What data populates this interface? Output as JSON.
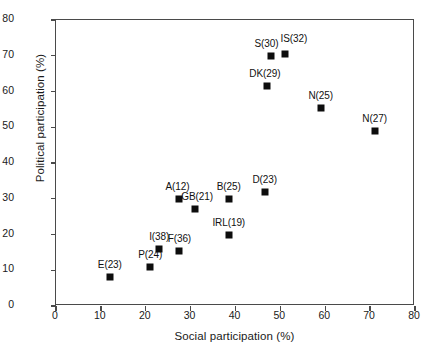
{
  "chart_data": {
    "type": "scatter",
    "title": "",
    "xlabel": "Social participation (%)",
    "ylabel": "Political participation (%)",
    "xlim": [
      0,
      80
    ],
    "ylim": [
      0,
      80
    ],
    "xticks": [
      0,
      10,
      20,
      30,
      40,
      50,
      60,
      70,
      80
    ],
    "yticks": [
      0,
      10,
      20,
      30,
      40,
      50,
      60,
      70,
      80
    ],
    "grid": false,
    "legend": "none",
    "marker_style": "filled-square-black",
    "points": [
      {
        "label": "E(23)",
        "x": 12,
        "y": 8,
        "label_dx": 0,
        "label_dy": -18
      },
      {
        "label": "P(24)",
        "x": 21,
        "y": 11,
        "label_dx": 0,
        "label_dy": -18
      },
      {
        "label": "I(38)",
        "x": 23,
        "y": 16,
        "label_dx": 0,
        "label_dy": -18
      },
      {
        "label": "F(36)",
        "x": 27.5,
        "y": 15.5,
        "label_dx": 0,
        "label_dy": -18
      },
      {
        "label": "A(12)",
        "x": 27.5,
        "y": 30,
        "label_dx": -2,
        "label_dy": -18
      },
      {
        "label": "GB(21)",
        "x": 31,
        "y": 27,
        "label_dx": 2,
        "label_dy": -18
      },
      {
        "label": "IRL(19)",
        "x": 38.5,
        "y": 20,
        "label_dx": 0,
        "label_dy": -18
      },
      {
        "label": "B(25)",
        "x": 38.5,
        "y": 30,
        "label_dx": 0,
        "label_dy": -18
      },
      {
        "label": "D(23)",
        "x": 46.5,
        "y": 32,
        "label_dx": 0,
        "label_dy": -18
      },
      {
        "label": "DK(29)",
        "x": 47,
        "y": 61.5,
        "label_dx": -2,
        "label_dy": -18
      },
      {
        "label": "S(30)",
        "x": 48,
        "y": 70,
        "label_dx": -5,
        "label_dy": -18
      },
      {
        "label": "IS(32)",
        "x": 51,
        "y": 70.5,
        "label_dx": 9,
        "label_dy": -21
      },
      {
        "label": "N(25)",
        "x": 59,
        "y": 55.5,
        "label_dx": 0,
        "label_dy": -18
      },
      {
        "label": "N(27)",
        "x": 71,
        "y": 49,
        "label_dx": 0,
        "label_dy": -18
      }
    ]
  }
}
